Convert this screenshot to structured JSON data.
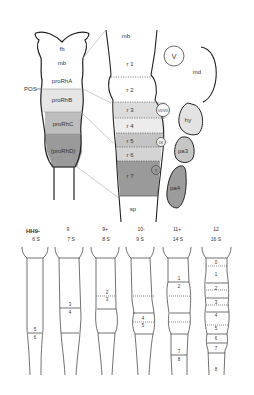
{
  "upper_left": {
    "regions": [
      {
        "label": "fb",
        "fill": "#ffffff"
      },
      {
        "label": "mb",
        "fill": "#ffffff"
      },
      {
        "label": "proRhA",
        "fill": "#ffffff"
      },
      {
        "label": "proRhB",
        "fill": "#e6e6e6"
      },
      {
        "label": "proRhC",
        "fill": "#bdbdbd"
      },
      {
        "label": "(proRhD)",
        "fill": "#9a9a9a"
      }
    ],
    "pos_label": "POS"
  },
  "upper_middle": {
    "top_label": "mb",
    "rhombomeres": [
      {
        "label": "r 1",
        "fill": "#ffffff"
      },
      {
        "label": "r 2",
        "fill": "#ffffff"
      },
      {
        "label": "r 3",
        "fill": "#dcdcdc"
      },
      {
        "label": "r 4",
        "fill": "#ececec"
      },
      {
        "label": "r 5",
        "fill": "#c4c4c4"
      },
      {
        "label": "r 6",
        "fill": "#d4d4d4"
      },
      {
        "label": "r 7",
        "fill": "#9a9a9a"
      }
    ],
    "bottom_label": "sp"
  },
  "upper_right": {
    "ganglia": [
      {
        "label": "V"
      },
      {
        "label": "VII/VIII"
      },
      {
        "label": "IX"
      },
      {
        "label": "X"
      }
    ],
    "arches": [
      {
        "label": "md",
        "fill": "#ffffff"
      },
      {
        "label": "hy",
        "fill": "#e3e3e3"
      },
      {
        "label": "pa3",
        "fill": "#c6c6c6"
      },
      {
        "label": "pa4",
        "fill": "#9c9c9c"
      }
    ]
  },
  "lower_panel": {
    "stages": [
      {
        "stage": "HH9-",
        "somites": "6 S",
        "boundary_labels": [
          "5",
          "6"
        ]
      },
      {
        "stage": "9",
        "somites": "7 S",
        "boundary_labels": [
          "3",
          "4"
        ]
      },
      {
        "stage": "9+",
        "somites": "8 S",
        "boundary_labels": [
          "2",
          "3"
        ]
      },
      {
        "stage": "10-",
        "somites": "9 S",
        "boundary_labels": [
          "4",
          "5"
        ]
      },
      {
        "stage": "11+",
        "somites": "14 S",
        "boundary_labels": [
          "1",
          "2",
          "7",
          "8"
        ]
      },
      {
        "stage": "12",
        "somites": "16 S",
        "boundary_labels": [
          "0",
          "1",
          "2",
          "3",
          "4",
          "5",
          "6",
          "7",
          "8"
        ]
      }
    ]
  }
}
